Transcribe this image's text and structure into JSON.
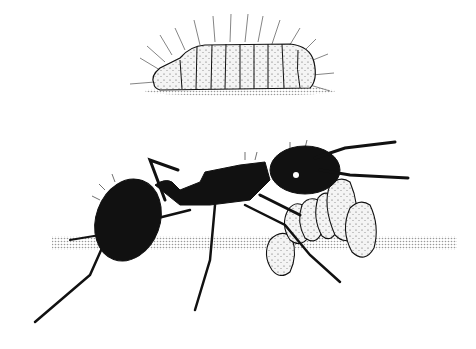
{
  "illustration": {
    "subject": "ant tending larvae",
    "colors": {
      "background": "#ffffff",
      "ink": "#111111",
      "larva_fill": "#f2f2f2",
      "ground_shadow": "#c8c8c8"
    }
  }
}
